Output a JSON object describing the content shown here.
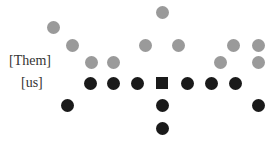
{
  "labels": {
    "them": "[Them]",
    "us": "[us]"
  },
  "colors": {
    "them": "#9a9a9a",
    "us": "#1a1a1a"
  },
  "them_players": [
    {
      "x": 53,
      "y": 27
    },
    {
      "x": 72,
      "y": 45
    },
    {
      "x": 91,
      "y": 62
    },
    {
      "x": 113,
      "y": 62
    },
    {
      "x": 162,
      "y": 12
    },
    {
      "x": 145,
      "y": 45
    },
    {
      "x": 178,
      "y": 45
    },
    {
      "x": 233,
      "y": 45
    },
    {
      "x": 258,
      "y": 45
    },
    {
      "x": 220,
      "y": 62
    },
    {
      "x": 258,
      "y": 62
    }
  ],
  "us_players": [
    {
      "x": 90,
      "y": 83
    },
    {
      "x": 113,
      "y": 83
    },
    {
      "x": 137,
      "y": 83
    },
    {
      "x": 187,
      "y": 83
    },
    {
      "x": 211,
      "y": 83
    },
    {
      "x": 235,
      "y": 83
    },
    {
      "x": 67,
      "y": 105
    },
    {
      "x": 162,
      "y": 105
    },
    {
      "x": 258,
      "y": 105
    },
    {
      "x": 162,
      "y": 128
    }
  ],
  "center": {
    "x": 162,
    "y": 83,
    "shape": "square"
  }
}
